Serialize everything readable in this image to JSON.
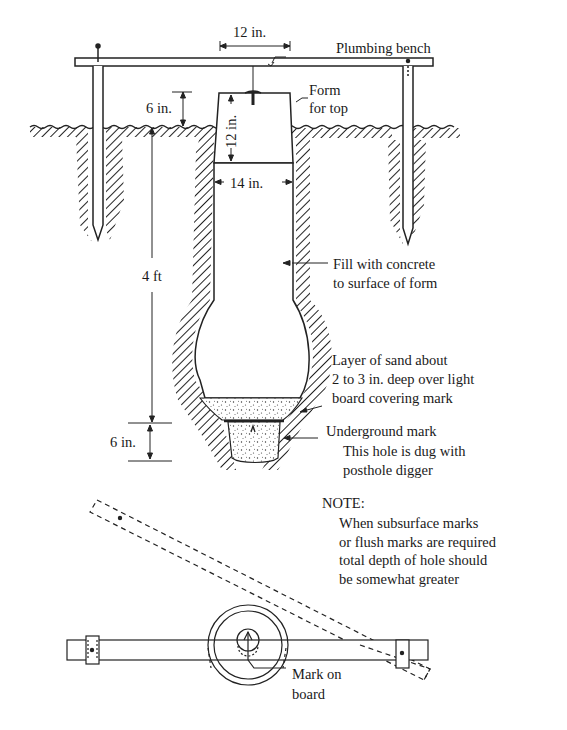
{
  "diagram": {
    "type": "technical cross-section",
    "dimensions": {
      "top_width": "12 in.",
      "form_height_above_ground": "6 in.",
      "form_depth": "12 in.",
      "form_bottom_width": "14 in.",
      "hole_depth": "4 ft",
      "mark_hole_depth": "6 in."
    },
    "labels": {
      "plumbing_bench": "Plumbing bench",
      "form_for_top_1": "Form",
      "form_for_top_2": "for top",
      "fill_1": "Fill with concrete",
      "fill_2": "to surface of form",
      "sand_1": "Layer of sand about",
      "sand_2": "2 to 3 in. deep over light",
      "sand_3": "board covering mark",
      "underground_mark": "Underground mark",
      "posthole_1": "This hole is dug with",
      "posthole_2": "posthole digger",
      "note_title": "NOTE:",
      "note_lines": [
        "When subsurface marks",
        "or flush marks are required",
        "total depth of hole should",
        "be somewhat greater"
      ],
      "mark_on_board_1": "Mark on",
      "mark_on_board_2": "board"
    }
  }
}
